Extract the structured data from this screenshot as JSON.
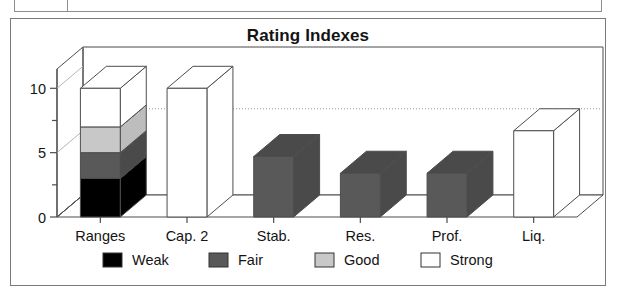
{
  "chart_data": {
    "type": "bar",
    "subtype": "3d-column-stacked-and-simple",
    "title": "Rating Indexes",
    "xlabel": "",
    "ylabel": "",
    "categories": [
      "Ranges",
      "Cap. 2",
      "Stab.",
      "Res.",
      "Prof.",
      "Liq."
    ],
    "ylim": [
      0,
      11.5
    ],
    "yticks_major": [
      0,
      5,
      10
    ],
    "yticks_minor": [
      2.5,
      7.5
    ],
    "ytick_labels": [
      "0",
      "5",
      "10"
    ],
    "grid": "horizontal-dotted-on-back-wall",
    "gridlines": [
      6.7,
      11.5
    ],
    "legend_position": "bottom",
    "legend": [
      {
        "name": "Weak",
        "color": "#000000"
      },
      {
        "name": "Fair",
        "color": "#595959"
      },
      {
        "name": "Good",
        "color": "#c8c8c8"
      },
      {
        "name": "Strong",
        "color": "#ffffff"
      }
    ],
    "series": [
      {
        "name": "Weak",
        "color": "#000000",
        "values": [
          3.0,
          null,
          null,
          null,
          null,
          null
        ]
      },
      {
        "name": "Fair",
        "color": "#595959",
        "values": [
          2.0,
          null,
          4.7,
          3.4,
          3.4,
          null
        ]
      },
      {
        "name": "Good",
        "color": "#c8c8c8",
        "values": [
          2.0,
          null,
          null,
          null,
          null,
          null
        ]
      },
      {
        "name": "Strong",
        "color": "#ffffff",
        "values": [
          3.0,
          10.0,
          null,
          null,
          null,
          6.7
        ]
      }
    ],
    "bars": [
      {
        "category": "Ranges",
        "stacked": true,
        "segments": [
          {
            "label": "Weak",
            "from": 0,
            "to": 3.0,
            "color": "#000000"
          },
          {
            "label": "Fair",
            "from": 3.0,
            "to": 5.0,
            "color": "#595959"
          },
          {
            "label": "Good",
            "from": 5.0,
            "to": 7.0,
            "color": "#c8c8c8"
          },
          {
            "label": "Strong",
            "from": 7.0,
            "to": 10.0,
            "color": "#ffffff"
          }
        ]
      },
      {
        "category": "Cap. 2",
        "stacked": false,
        "value": 10.0,
        "label": "Strong",
        "color": "#ffffff"
      },
      {
        "category": "Stab.",
        "stacked": false,
        "value": 4.7,
        "label": "Fair",
        "color": "#595959"
      },
      {
        "category": "Res.",
        "stacked": false,
        "value": 3.4,
        "label": "Fair",
        "color": "#595959"
      },
      {
        "category": "Prof.",
        "stacked": false,
        "value": 3.4,
        "label": "Fair",
        "color": "#595959"
      },
      {
        "category": "Liq.",
        "stacked": false,
        "value": 6.7,
        "label": "Strong",
        "color": "#ffffff"
      }
    ]
  },
  "chart": {
    "title": "Rating Indexes"
  },
  "axis": {
    "y_labels": [
      "10",
      "5",
      "0"
    ]
  },
  "categories": {
    "c0": "Ranges",
    "c1": "Cap. 2",
    "c2": "Stab.",
    "c3": "Res.",
    "c4": "Prof.",
    "c5": "Liq."
  },
  "legend": {
    "items": [
      {
        "label": "Weak"
      },
      {
        "label": "Fair"
      },
      {
        "label": "Good"
      },
      {
        "label": "Strong"
      }
    ]
  }
}
